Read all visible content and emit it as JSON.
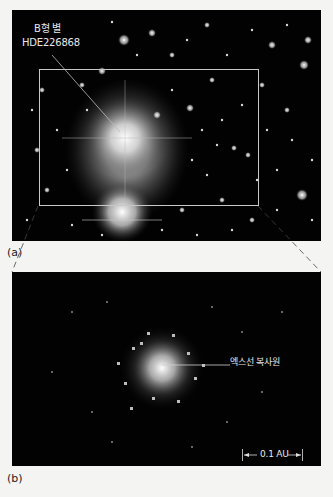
{
  "figure": {
    "panel_a": {
      "caption": "(a)",
      "star_label_line1": "B형 별",
      "star_label_line2": "HDE226868",
      "inset_box_color": "#c8c8c8"
    },
    "panel_b": {
      "caption": "(b)",
      "source_label": "엑스선 복사원",
      "scale_bar_label": "0.1 AU",
      "scale_left_arrow": "|←",
      "scale_right_arrow": "→|"
    },
    "colors": {
      "background": "#f4f4f2",
      "image_background": "#020202",
      "label_text": "#e8e8e8"
    }
  }
}
